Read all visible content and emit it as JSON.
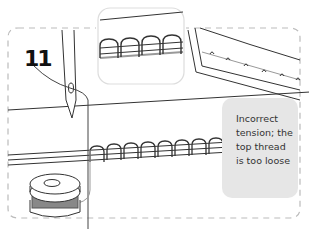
{
  "diagram": {
    "step_number": "11",
    "caption": "Incorrect tension; the top thread is too loose",
    "caption_lines": [
      "Incorrect",
      "tension;",
      "the top",
      "thread is",
      "too loose"
    ],
    "elements": [
      "needle",
      "top-thread",
      "bobbin",
      "bobbin-thread",
      "fabric-layers",
      "stitch-loops",
      "zoom-inset",
      "fabric-corner-seam"
    ],
    "colors": {
      "line": "#333333",
      "dashed_border": "#bbbbbb",
      "caption_bg": "#e6e6e6",
      "bobbin_thread": "#999999"
    }
  }
}
